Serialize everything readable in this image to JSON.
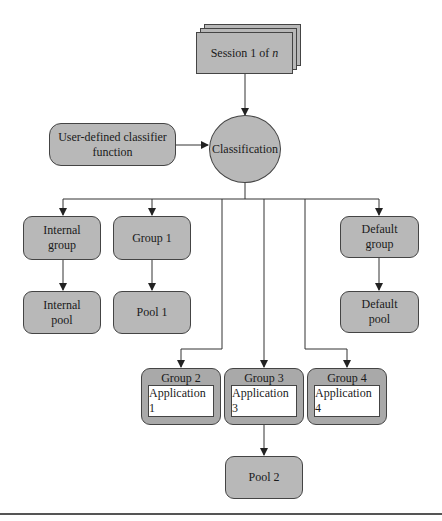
{
  "diagram": {
    "session": {
      "label": "Session 1 of ",
      "label_italic": "n"
    },
    "classifier_function": {
      "line1": "User-defined classifier",
      "line2": "function"
    },
    "classification": {
      "label": "Classification"
    },
    "internal_group": {
      "line1": "Internal",
      "line2": "group"
    },
    "group1": {
      "label": "Group 1"
    },
    "default_group": {
      "line1": "Default",
      "line2": "group"
    },
    "internal_pool": {
      "line1": "Internal",
      "line2": "pool"
    },
    "pool1": {
      "label": "Pool 1"
    },
    "default_pool": {
      "line1": "Default",
      "line2": "pool"
    },
    "app_groups": [
      {
        "group": "Group 2",
        "application": "Application 1"
      },
      {
        "group": "Group 3",
        "application": "Application 3"
      },
      {
        "group": "Group 4",
        "application": "Application 4"
      }
    ],
    "pool2": {
      "label": "Pool 2"
    },
    "colors": {
      "node_fill": "#b8b8b8",
      "group_fill": "#a9a9a9",
      "stroke": "#444444",
      "app_fill": "#ffffff"
    }
  }
}
